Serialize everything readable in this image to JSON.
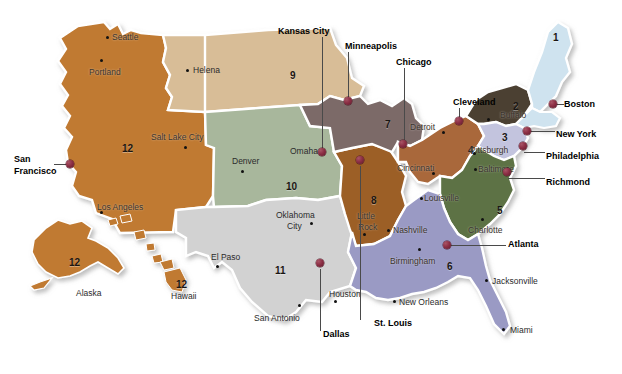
{
  "map": {
    "title": "Federal Reserve Districts Map",
    "background_color": "#ffffff",
    "pin_color": "#8d2f45",
    "border_color": "#ffffff"
  },
  "districts": [
    {
      "number": "1",
      "name": "Boston",
      "color": "#cfe3ef"
    },
    {
      "number": "2",
      "name": "New York",
      "color": "#4c4033"
    },
    {
      "number": "3",
      "name": "Philadelphia",
      "color": "#c3c4de"
    },
    {
      "number": "4",
      "name": "Cleveland",
      "color": "#a9673a"
    },
    {
      "number": "5",
      "name": "Richmond",
      "color": "#5d7244"
    },
    {
      "number": "6",
      "name": "Atlanta",
      "color": "#9a9ac4"
    },
    {
      "number": "7",
      "name": "Chicago",
      "color": "#7b6a68"
    },
    {
      "number": "8",
      "name": "St. Louis",
      "color": "#9c5f28"
    },
    {
      "number": "9",
      "name": "Minneapolis",
      "color": "#d8bd97"
    },
    {
      "number": "10",
      "name": "Kansas City",
      "color": "#a8b79c"
    },
    {
      "number": "11",
      "name": "Dallas",
      "color": "#d2d2d2"
    },
    {
      "number": "12",
      "name": "San Francisco",
      "color": "#c07a32"
    }
  ],
  "district_numbers": [
    {
      "label": "1",
      "x": 553,
      "y": 33
    },
    {
      "label": "2",
      "x": 513,
      "y": 102
    },
    {
      "label": "3",
      "x": 502,
      "y": 133
    },
    {
      "label": "4",
      "x": 468,
      "y": 146
    },
    {
      "label": "5",
      "x": 497,
      "y": 206
    },
    {
      "label": "6",
      "x": 447,
      "y": 262
    },
    {
      "label": "7",
      "x": 385,
      "y": 120
    },
    {
      "label": "8",
      "x": 371,
      "y": 196
    },
    {
      "label": "9",
      "x": 290,
      "y": 71
    },
    {
      "label": "10",
      "x": 286,
      "y": 182
    },
    {
      "label": "11",
      "x": 275,
      "y": 266
    },
    {
      "label": "12",
      "x": 122,
      "y": 144
    },
    {
      "label": "12",
      "x": 69,
      "y": 258
    },
    {
      "label": "12",
      "x": 176,
      "y": 280
    }
  ],
  "reserve_banks": [
    {
      "name": "Boston",
      "label_x": 564,
      "label_y": 100,
      "pin_x": 549,
      "pin_y": 100,
      "leader": {
        "x": 552,
        "y": 104,
        "w": 12,
        "h": 1,
        "orient": "h"
      }
    },
    {
      "name": "New York",
      "label_x": 556,
      "label_y": 130,
      "pin_x": 523,
      "pin_y": 127,
      "leader": {
        "x": 527,
        "y": 131,
        "w": 28,
        "h": 1,
        "orient": "h"
      }
    },
    {
      "name": "Philadelphia",
      "label_x": 546,
      "label_y": 152,
      "pin_x": 519,
      "pin_y": 142,
      "leader": {
        "x": 524,
        "y": 152,
        "w": 21,
        "h": 1,
        "orient": "h"
      }
    },
    {
      "name": "Richmond",
      "label_x": 546,
      "label_y": 178,
      "pin_x": 503,
      "pin_y": 168,
      "leader": {
        "x": 508,
        "y": 178,
        "w": 37,
        "h": 1,
        "orient": "h"
      }
    },
    {
      "name": "Cleveland",
      "label_x": 453,
      "label_y": 98,
      "pin_x": 455,
      "pin_y": 117,
      "leader": {
        "x": 459,
        "y": 108,
        "w": 1,
        "h": 12,
        "orient": "v"
      }
    },
    {
      "name": "Atlanta",
      "label_x": 508,
      "label_y": 240,
      "pin_x": 443,
      "pin_y": 241,
      "leader": {
        "x": 450,
        "y": 245,
        "w": 56,
        "h": 1,
        "orient": "h"
      }
    },
    {
      "name": "Chicago",
      "label_x": 396,
      "label_y": 58,
      "pin_x": 399,
      "pin_y": 140,
      "leader": {
        "x": 404,
        "y": 68,
        "w": 1,
        "h": 72,
        "orient": "v"
      }
    },
    {
      "name": "Minneapolis",
      "label_x": 345,
      "label_y": 42,
      "pin_x": 344,
      "pin_y": 97,
      "leader": {
        "x": 348,
        "y": 52,
        "w": 1,
        "h": 46,
        "orient": "v"
      }
    },
    {
      "name": "Kansas City",
      "label_x": 278,
      "label_y": 27,
      "pin_x": 318,
      "pin_y": 148,
      "leader": {
        "x": 322,
        "y": 37,
        "w": 1,
        "h": 112,
        "orient": "v"
      }
    },
    {
      "name": "St. Louis",
      "label_x": 374,
      "label_y": 319,
      "pin_x": 356,
      "pin_y": 156,
      "leader": {
        "x": 360,
        "y": 166,
        "w": 1,
        "h": 154,
        "orient": "v"
      }
    },
    {
      "name": "Dallas",
      "label_x": 323,
      "label_y": 330,
      "pin_x": 316,
      "pin_y": 259,
      "leader": {
        "x": 320,
        "y": 269,
        "w": 1,
        "h": 62,
        "orient": "v"
      }
    },
    {
      "name": "San Francisco",
      "label_x": 14,
      "label_y": 155,
      "pin_x": 66,
      "pin_y": 160,
      "leader": {
        "x": 54,
        "y": 164,
        "w": 14,
        "h": 1,
        "orient": "h"
      }
    }
  ],
  "san_francisco_second_line": "Francisco",
  "cities": [
    {
      "name": "Seattle",
      "label_x": 112,
      "label_y": 33,
      "dot_x": 106,
      "dot_y": 36,
      "style": "onmap"
    },
    {
      "name": "Portland",
      "label_x": 89,
      "label_y": 68,
      "dot_x": 100,
      "dot_y": 59,
      "style": "onmap"
    },
    {
      "name": "Helena",
      "label_x": 193,
      "label_y": 66,
      "dot_x": 186,
      "dot_y": 69,
      "style": "city"
    },
    {
      "name": "Salt Lake City",
      "label_x": 151,
      "label_y": 133,
      "dot_x": 184,
      "dot_y": 146,
      "style": "onmap"
    },
    {
      "name": "Denver",
      "label_x": 232,
      "label_y": 157,
      "dot_x": 241,
      "dot_y": 170,
      "style": "city"
    },
    {
      "name": "Omaha",
      "label_x": 290,
      "label_y": 147,
      "dot_x": 321,
      "dot_y": 150,
      "style": "city"
    },
    {
      "name": "Los Angeles",
      "label_x": 97,
      "label_y": 203,
      "dot_x": 100,
      "dot_y": 211,
      "style": "onmap"
    },
    {
      "name": "Oklahoma",
      "label_x": 276,
      "label_y": 211,
      "dot_x": 310,
      "dot_y": 222,
      "style": "city"
    },
    {
      "name": "City",
      "label_x": 287,
      "label_y": 222,
      "dot_x": -99,
      "dot_y": -99,
      "style": "city"
    },
    {
      "name": "El Paso",
      "label_x": 211,
      "label_y": 253,
      "dot_x": 216,
      "dot_y": 265,
      "style": "city"
    },
    {
      "name": "San Antonio",
      "label_x": 254,
      "label_y": 314,
      "dot_x": 298,
      "dot_y": 304,
      "style": "city"
    },
    {
      "name": "Houston",
      "label_x": 329,
      "label_y": 290,
      "dot_x": 334,
      "dot_y": 300,
      "style": "city"
    },
    {
      "name": "New Orleans",
      "label_x": 399,
      "label_y": 298,
      "dot_x": 393,
      "dot_y": 300,
      "style": "city"
    },
    {
      "name": "Little",
      "label_x": 357,
      "label_y": 212,
      "dot_x": 363,
      "dot_y": 233,
      "style": "onmap"
    },
    {
      "name": "Rock",
      "label_x": 358,
      "label_y": 223,
      "dot_x": -99,
      "dot_y": -99,
      "style": "onmap"
    },
    {
      "name": "Nashville",
      "label_x": 393,
      "label_y": 226,
      "dot_x": 387,
      "dot_y": 229,
      "style": "onmap"
    },
    {
      "name": "Birmingham",
      "label_x": 390,
      "label_y": 257,
      "dot_x": 418,
      "dot_y": 248,
      "style": "onmap"
    },
    {
      "name": "Louisville",
      "label_x": 424,
      "label_y": 194,
      "dot_x": 420,
      "dot_y": 197,
      "style": "onmap"
    },
    {
      "name": "Cincinnati",
      "label_x": 397,
      "label_y": 164,
      "dot_x": 432,
      "dot_y": 172,
      "style": "onmap"
    },
    {
      "name": "Detroit",
      "label_x": 410,
      "label_y": 123,
      "dot_x": 442,
      "dot_y": 131,
      "style": "onmap"
    },
    {
      "name": "Buffalo",
      "label_x": 500,
      "label_y": 111,
      "dot_x": 487,
      "dot_y": 118,
      "style": "onmap"
    },
    {
      "name": "Pittsburgh",
      "label_x": 470,
      "label_y": 146,
      "dot_x": 473,
      "dot_y": 152,
      "style": "onmap"
    },
    {
      "name": "Baltimore",
      "label_x": 478,
      "label_y": 165,
      "dot_x": 474,
      "dot_y": 168,
      "style": "onmap"
    },
    {
      "name": "Charlotte",
      "label_x": 468,
      "label_y": 226,
      "dot_x": 481,
      "dot_y": 218,
      "style": "onmap"
    },
    {
      "name": "Jacksonville",
      "label_x": 492,
      "label_y": 277,
      "dot_x": 485,
      "dot_y": 279,
      "style": "city"
    },
    {
      "name": "Miami",
      "label_x": 510,
      "label_y": 326,
      "dot_x": 502,
      "dot_y": 328,
      "style": "city"
    }
  ],
  "insets": [
    {
      "name": "Alaska",
      "label_x": 76,
      "label_y": 289
    },
    {
      "name": "Hawaii",
      "label_x": 171,
      "label_y": 292
    }
  ]
}
